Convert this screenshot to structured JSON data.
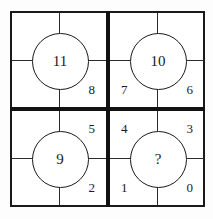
{
  "diagram": {
    "colors": {
      "line": "#1a1a1a",
      "thin_line": "#2b2b2b",
      "background": "#ffffff"
    },
    "quadrants": [
      {
        "id": "top-left",
        "circle": "11",
        "cells": [
          {
            "position": "bottom-right",
            "value": "8"
          }
        ]
      },
      {
        "id": "top-right",
        "circle": "10",
        "cells": [
          {
            "position": "bottom-left",
            "value": "7"
          },
          {
            "position": "bottom-right",
            "value": "6"
          }
        ]
      },
      {
        "id": "bottom-left",
        "circle": "9",
        "cells": [
          {
            "position": "top-right",
            "value": "5"
          },
          {
            "position": "bottom-right",
            "value": "2"
          }
        ]
      },
      {
        "id": "bottom-right",
        "circle": "?",
        "cells": [
          {
            "position": "top-left",
            "value": "4"
          },
          {
            "position": "top-right",
            "value": "3"
          },
          {
            "position": "bottom-left",
            "value": "1"
          },
          {
            "position": "bottom-right",
            "value": "0"
          }
        ]
      }
    ]
  }
}
